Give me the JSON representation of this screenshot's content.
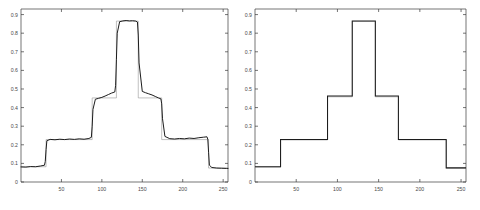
{
  "figure": {
    "background": "#ffffff",
    "panel_count": 2
  },
  "panels": [
    {
      "id": "left",
      "name": "noisy-signal-panel",
      "box": {
        "x": 21,
        "y": 9,
        "w": 207,
        "h": 173
      }
    },
    {
      "id": "right",
      "name": "clean-signal-panel",
      "box": {
        "x": 255,
        "y": 9,
        "w": 211,
        "h": 173
      }
    }
  ],
  "axes": {
    "x_ticks": [
      50,
      100,
      150,
      200,
      250
    ],
    "x_tick_labels": [
      "50",
      "100",
      "150",
      "200",
      "250"
    ],
    "y_ticks": [
      0,
      0.1,
      0.2,
      0.3,
      0.4,
      0.5,
      0.6,
      0.7,
      0.8,
      0.9
    ],
    "y_tick_labels": [
      "0",
      "0.1",
      "0.2",
      "0.3",
      "0.4",
      "0.5",
      "0.6",
      "0.7",
      "0.8",
      "0.9"
    ],
    "xlim": [
      0,
      256
    ],
    "ylim": [
      0,
      0.93
    ],
    "grid": false,
    "line_color": "#1c1c1c",
    "axis_color": "#3a3a3a"
  },
  "chart_data": [
    {
      "type": "line",
      "name": "left-noisy-staircase",
      "title": "",
      "subtitle": "",
      "xlabel": "",
      "ylabel": "",
      "xlim": [
        0,
        256
      ],
      "ylim": [
        0,
        0.93
      ],
      "grid": false,
      "legend": null,
      "legend_position": "none",
      "x_ticks": [
        50,
        100,
        150,
        200,
        250
      ],
      "y_ticks": [
        0,
        0.1,
        0.2,
        0.3,
        0.4,
        0.5,
        0.6,
        0.7,
        0.8,
        0.9
      ],
      "annotations": [],
      "plateau_levels": [
        0.082,
        0.228,
        0.452,
        0.865
      ],
      "breakpoints": [
        31,
        88,
        118,
        145,
        174,
        232
      ],
      "series": [
        {
          "name": "measured",
          "color": "#1c1c1c",
          "x": [
            0,
            6,
            12,
            18,
            24,
            29,
            30,
            31,
            32,
            36,
            42,
            48,
            54,
            60,
            66,
            72,
            78,
            84,
            87,
            88,
            89,
            92,
            96,
            100,
            104,
            108,
            112,
            116,
            117,
            118,
            119,
            122,
            126,
            130,
            134,
            138,
            142,
            144,
            145,
            146,
            150,
            154,
            158,
            162,
            166,
            170,
            173,
            174,
            175,
            178,
            184,
            190,
            196,
            202,
            208,
            214,
            220,
            226,
            230,
            231,
            232,
            233,
            236,
            242,
            248,
            254,
            256
          ],
          "y": [
            0.081,
            0.08,
            0.083,
            0.082,
            0.086,
            0.09,
            0.11,
            0.175,
            0.222,
            0.229,
            0.227,
            0.23,
            0.228,
            0.231,
            0.229,
            0.232,
            0.23,
            0.234,
            0.24,
            0.3,
            0.39,
            0.445,
            0.45,
            0.455,
            0.462,
            0.47,
            0.478,
            0.484,
            0.52,
            0.66,
            0.8,
            0.862,
            0.866,
            0.868,
            0.866,
            0.867,
            0.865,
            0.86,
            0.79,
            0.64,
            0.487,
            0.48,
            0.474,
            0.468,
            0.46,
            0.452,
            0.447,
            0.42,
            0.34,
            0.245,
            0.233,
            0.231,
            0.234,
            0.232,
            0.236,
            0.234,
            0.238,
            0.241,
            0.243,
            0.23,
            0.16,
            0.09,
            0.078,
            0.075,
            0.074,
            0.073,
            0.073
          ]
        },
        {
          "name": "reference-overlay",
          "color": "#8c8c8c",
          "x": [
            0,
            31,
            31,
            88,
            88,
            118,
            118,
            145,
            145,
            174,
            174,
            232,
            232,
            256
          ],
          "y": [
            0.082,
            0.082,
            0.228,
            0.228,
            0.452,
            0.452,
            0.865,
            0.865,
            0.452,
            0.452,
            0.228,
            0.228,
            0.075,
            0.075
          ]
        }
      ]
    },
    {
      "type": "line",
      "name": "right-clean-staircase",
      "title": "",
      "subtitle": "",
      "xlabel": "",
      "ylabel": "",
      "xlim": [
        0,
        256
      ],
      "ylim": [
        0,
        0.93
      ],
      "grid": false,
      "legend": null,
      "legend_position": "none",
      "x_ticks": [
        50,
        100,
        150,
        200,
        250
      ],
      "y_ticks": [
        0,
        0.1,
        0.2,
        0.3,
        0.4,
        0.5,
        0.6,
        0.7,
        0.8,
        0.9
      ],
      "annotations": [],
      "plateau_levels": [
        0.082,
        0.228,
        0.462,
        0.866
      ],
      "breakpoints": [
        31,
        88,
        118,
        146,
        174,
        232
      ],
      "series": [
        {
          "name": "ideal",
          "color": "#1c1c1c",
          "x": [
            0,
            31,
            31,
            88,
            88,
            118,
            118,
            146,
            146,
            174,
            174,
            232,
            232,
            256
          ],
          "y": [
            0.082,
            0.082,
            0.228,
            0.228,
            0.462,
            0.462,
            0.866,
            0.866,
            0.462,
            0.462,
            0.228,
            0.228,
            0.076,
            0.076
          ]
        },
        {
          "name": "estimate-overlay",
          "color": "#8c8c8c",
          "x": [
            0,
            31,
            31,
            88,
            88,
            118,
            118,
            146,
            146,
            174,
            174,
            232,
            232,
            256
          ],
          "y": [
            0.08,
            0.08,
            0.226,
            0.226,
            0.458,
            0.458,
            0.863,
            0.863,
            0.458,
            0.458,
            0.226,
            0.226,
            0.074,
            0.074
          ]
        }
      ]
    }
  ]
}
